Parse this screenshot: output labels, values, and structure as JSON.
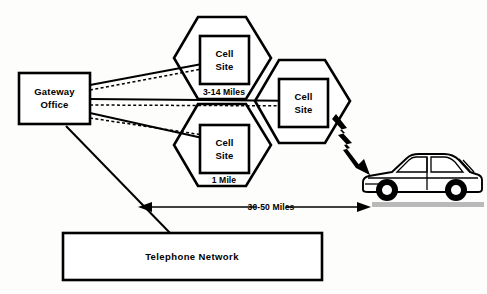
{
  "diagram": {
    "background_color": "#fdfdfb",
    "ink_color": "#000000",
    "road_color": "#b9b9b9",
    "nodes": {
      "gateway_office": {
        "line1": "Gateway",
        "line2": "Office"
      },
      "cell_site_top": {
        "line1": "Cell",
        "line2": "Site"
      },
      "cell_site_bottom": {
        "line1": "Cell",
        "line2": "Site"
      },
      "cell_site_right": {
        "line1": "Cell",
        "line2": "Site"
      },
      "telephone_network": {
        "label": "Telephone  Network"
      }
    },
    "labels": {
      "cell_radius_range": "3-14 Miles",
      "cell_radius_min": "1 Mile",
      "system_span": "30-50 Miles"
    },
    "icons": {
      "rf_link": "lightning-bolt-icon",
      "mobile_unit": "car-icon"
    }
  }
}
